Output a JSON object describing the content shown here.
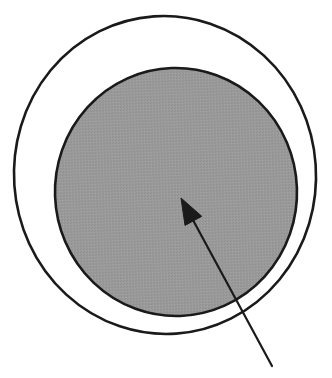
{
  "figure": {
    "background_color": "#ffffff",
    "caption": "",
    "width": 332,
    "height": 378
  },
  "chart_data": {
    "type": "diagram",
    "subtitle": "",
    "xlabel": "",
    "ylabel": "",
    "grid": false,
    "legend": "none",
    "annotations": [
      {
        "name": "pointer-arrow",
        "kind": "arrow",
        "label": "",
        "tip_x": 181,
        "tip_y": 198,
        "tail_x": 272,
        "tail_y": 366,
        "color": "#1a1a1a",
        "line_width": 2.2,
        "head_length": 26,
        "head_width": 19
      }
    ],
    "shapes": [
      {
        "name": "outer-circle",
        "kind": "circle",
        "center_x": 165,
        "center_y": 175,
        "radius_x": 151,
        "radius_y": 159,
        "rotation": -4,
        "fill": "none",
        "stroke": "#1a1a1a",
        "stroke_width": 2.6
      },
      {
        "name": "inner-shaded-circle",
        "kind": "circle",
        "center_x": 176,
        "center_y": 192,
        "radius_x": 121,
        "radius_y": 124,
        "rotation": -2,
        "fill": "#9a9a9a",
        "stroke": "#1a1a1a",
        "stroke_width": 2.6
      }
    ],
    "colors": {
      "stroke": "#1a1a1a",
      "shaded_fill": "#9a9a9a",
      "background": "#ffffff",
      "arrow": "#1a1a1a"
    }
  }
}
